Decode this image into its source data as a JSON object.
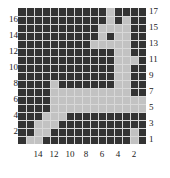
{
  "chart_data": {
    "type": "heatmap",
    "title": "",
    "xlabel": "",
    "ylabel": "",
    "ncols": 16,
    "nrows": 17,
    "x_tick_labels": [
      "14",
      "12",
      "10",
      "8",
      "6",
      "4",
      "2"
    ],
    "x_tick_columns": [
      14,
      12,
      10,
      8,
      6,
      4,
      2
    ],
    "x_axis_direction": "reversed",
    "y_tick_labels_left": [
      "16",
      "14",
      "12",
      "10",
      "8",
      "6",
      "4",
      "2"
    ],
    "y_tick_rows_left": [
      16,
      14,
      12,
      10,
      8,
      6,
      4,
      2
    ],
    "y_tick_labels_right": [
      "17",
      "15",
      "13",
      "11",
      "9",
      "7",
      "5",
      "3",
      "1"
    ],
    "y_tick_rows_right": [
      17,
      15,
      13,
      11,
      9,
      7,
      5,
      3,
      1
    ],
    "xlim": [
      16,
      1
    ],
    "ylim": [
      1,
      17
    ],
    "grid": true,
    "legend": "none",
    "colors": {
      "on": "#333333",
      "off": "#c2c2c2",
      "gridline": "#d8d8d8",
      "background": "#ffffff",
      "text": "#1a1a1a"
    },
    "value_legend": {
      "on": "dark cell (value 1)",
      "off": "light cell (value 0)"
    },
    "matrix_row_order": "top row is y=17, bottom row is y=1",
    "matrix_column_order": "left column is x=16, right column is x=1",
    "matrix": [
      [
        1,
        1,
        1,
        1,
        1,
        1,
        1,
        1,
        1,
        1,
        1,
        0,
        1,
        1,
        1,
        1
      ],
      [
        1,
        1,
        1,
        1,
        1,
        1,
        1,
        1,
        1,
        1,
        1,
        0,
        1,
        0,
        1,
        1
      ],
      [
        1,
        1,
        1,
        1,
        1,
        1,
        1,
        1,
        1,
        1,
        0,
        0,
        0,
        0,
        1,
        1
      ],
      [
        1,
        1,
        1,
        1,
        1,
        1,
        1,
        1,
        1,
        1,
        0,
        1,
        0,
        0,
        1,
        1
      ],
      [
        1,
        1,
        1,
        1,
        1,
        1,
        1,
        1,
        1,
        0,
        0,
        0,
        0,
        0,
        1,
        1
      ],
      [
        1,
        1,
        1,
        1,
        1,
        1,
        1,
        1,
        1,
        1,
        1,
        1,
        0,
        0,
        1,
        1
      ],
      [
        1,
        1,
        1,
        1,
        1,
        1,
        1,
        1,
        1,
        1,
        1,
        1,
        0,
        0,
        0,
        1
      ],
      [
        1,
        1,
        1,
        1,
        1,
        1,
        1,
        1,
        1,
        1,
        1,
        1,
        0,
        0,
        1,
        1
      ],
      [
        1,
        1,
        1,
        1,
        1,
        1,
        1,
        1,
        1,
        1,
        1,
        1,
        0,
        0,
        1,
        1
      ],
      [
        1,
        1,
        1,
        1,
        0,
        1,
        1,
        1,
        1,
        1,
        1,
        1,
        0,
        0,
        1,
        1
      ],
      [
        1,
        1,
        1,
        1,
        0,
        0,
        0,
        0,
        0,
        0,
        0,
        0,
        0,
        0,
        1,
        1
      ],
      [
        1,
        1,
        1,
        1,
        0,
        0,
        0,
        0,
        0,
        0,
        0,
        0,
        0,
        0,
        0,
        0
      ],
      [
        1,
        1,
        1,
        1,
        0,
        0,
        0,
        0,
        0,
        0,
        0,
        0,
        0,
        0,
        0,
        0
      ],
      [
        1,
        1,
        1,
        0,
        0,
        0,
        1,
        1,
        1,
        1,
        1,
        1,
        1,
        1,
        1,
        1
      ],
      [
        1,
        1,
        0,
        0,
        0,
        1,
        1,
        1,
        1,
        1,
        1,
        1,
        1,
        1,
        1,
        1
      ],
      [
        1,
        1,
        0,
        0,
        1,
        1,
        1,
        1,
        1,
        1,
        1,
        1,
        1,
        1,
        0,
        1
      ],
      [
        1,
        0,
        0,
        1,
        1,
        1,
        1,
        1,
        1,
        1,
        1,
        1,
        1,
        1,
        0,
        1
      ]
    ]
  }
}
